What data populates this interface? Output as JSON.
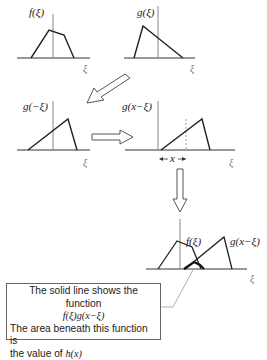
{
  "panels": {
    "f": {
      "label": "f(ξ)",
      "axis": "ξ"
    },
    "g": {
      "label": "g(ξ)",
      "axis": "ξ"
    },
    "g_reflected": {
      "label": "g(−ξ)",
      "axis": "ξ"
    },
    "g_shifted": {
      "label": "g(x−ξ)",
      "axis": "ξ",
      "shift_label": "x"
    },
    "product": {
      "f_label": "f(ξ)",
      "g_label": "g(x−ξ)",
      "axis": "ξ"
    }
  },
  "callout": {
    "line1": "The solid line shows the function",
    "line2": "f(ξ)g(x−ξ)",
    "line3": "The area beneath this function is",
    "line4_prefix": "the value of ",
    "line4_var": "h(x)"
  },
  "colors": {
    "line": "#222222",
    "axis": "#888888",
    "arrow": "#555555"
  }
}
